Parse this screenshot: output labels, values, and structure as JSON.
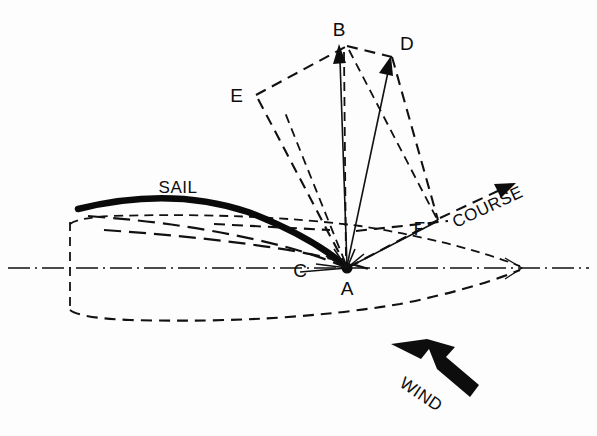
{
  "figure": {
    "type": "force-vector-diagram",
    "background_color": "#fdfdfd",
    "ink_color": "#0d0d0d"
  },
  "labels": {
    "point_a": "A",
    "point_b": "B",
    "point_c": "C",
    "point_d": "D",
    "point_e": "E",
    "point_f": "F",
    "sail": "SAIL",
    "course": "COURSE",
    "wind": "WIND"
  },
  "points": {
    "a": {
      "x": 347,
      "y": 268
    },
    "b": {
      "x": 347,
      "y": 46
    },
    "c": {
      "x": 313,
      "y": 265
    },
    "d": {
      "x": 392,
      "y": 57
    },
    "e": {
      "x": 256,
      "y": 95
    },
    "f": {
      "x": 438,
      "y": 220
    }
  },
  "vectors": [
    {
      "name": "total-sail-force",
      "from": "a",
      "to": "b",
      "style": "solid-arrow"
    },
    {
      "name": "driving-force",
      "from": "a",
      "to": "d",
      "style": "solid-arrow"
    },
    {
      "name": "heeling-component",
      "from": "a",
      "to": "e",
      "style": "dash-dot"
    },
    {
      "name": "course-component",
      "from": "a",
      "to": "f",
      "style": "solid"
    }
  ],
  "parallelogram": {
    "name": "force-parallelogram",
    "vertices": [
      "e",
      "b",
      "d",
      "f"
    ],
    "style": "dashed"
  },
  "hull": {
    "name": "boat-hull",
    "style": "dashed",
    "bow_x": 520,
    "stern_x": 70,
    "waterline_y": 268
  },
  "sail_curve": {
    "name": "sail-profile",
    "style": "thick-solid",
    "luff": {
      "x": 78,
      "y": 208
    },
    "peak": {
      "x": 215,
      "y": 196
    },
    "clew": {
      "x": 347,
      "y": 268
    }
  },
  "wind_arrow": {
    "name": "wind-direction-arrow",
    "style": "thick-filled",
    "tail": {
      "x": 472,
      "y": 400
    },
    "head": {
      "x": 392,
      "y": 345
    },
    "text_rotation_deg": 34
  },
  "course_arrow": {
    "name": "course-direction-arrow",
    "style": "dashed-with-arrowhead",
    "tail": {
      "x": 438,
      "y": 220
    },
    "head": {
      "x": 512,
      "y": 186
    },
    "text_rotation_deg": -25
  }
}
